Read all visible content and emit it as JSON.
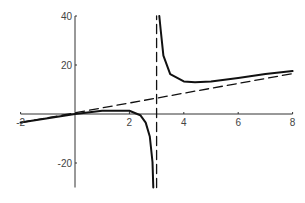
{
  "chart_data": {
    "type": "line",
    "title": "",
    "xlabel": "",
    "ylabel": "",
    "xlim": [
      -2,
      8
    ],
    "ylim": [
      -30,
      40
    ],
    "grid": false,
    "legend": null,
    "x_ticks": [
      -2,
      2,
      4,
      6,
      8
    ],
    "x_tick_labels": [
      "-2",
      "2",
      "4",
      "6",
      "8"
    ],
    "y_ticks": [
      -20,
      20,
      40
    ],
    "y_tick_labels": [
      "-20",
      "20",
      "40"
    ],
    "series": [
      {
        "name": "f(x) left branch",
        "style": "solid",
        "x": [
          -2,
          -1,
          0,
          1,
          2,
          2.4,
          2.6,
          2.75,
          2.85,
          2.88
        ],
        "y": [
          -3.5,
          -1.7,
          0,
          1.3,
          1.3,
          -0.5,
          -3.5,
          -9.2,
          -19.6,
          -30
        ]
      },
      {
        "name": "f(x) right branch",
        "style": "solid",
        "x": [
          3.1,
          3.15,
          3.25,
          3.5,
          4,
          4.41,
          5,
          6,
          7,
          8
        ],
        "y": [
          40,
          34.3,
          23.8,
          16.3,
          13.3,
          13.0,
          13.3,
          14.7,
          16.3,
          17.5
        ]
      },
      {
        "name": "slant asymptote",
        "style": "dashed",
        "x": [
          -2,
          8
        ],
        "y": [
          -3.5,
          16.5
        ]
      },
      {
        "name": "vertical asymptote x=3",
        "style": "dashed",
        "x": [
          3,
          3
        ],
        "y": [
          -30,
          40
        ]
      }
    ],
    "annotations": []
  },
  "plot": {
    "axis_color": "#333333",
    "curve_color": "#111111"
  }
}
